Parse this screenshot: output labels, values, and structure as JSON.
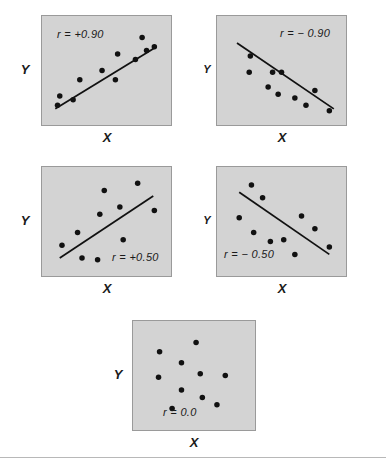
{
  "figure": {
    "background": "#ffffff",
    "panel_fill": "#d3d3d3",
    "panel_border": "#9a9a9a",
    "point_color": "#111111",
    "line_color": "#111111",
    "rule_y": 457
  },
  "labels": {
    "x_axis": "X",
    "y_axis": "Y"
  },
  "chart_data": [
    {
      "id": "panel-r-plus-090",
      "type": "scatter",
      "title": "",
      "annotation": "r = +0.90",
      "r_value": 0.9,
      "xlabel": "X",
      "ylabel": "Y",
      "xlim": [
        0,
        100
      ],
      "ylim": [
        0,
        100
      ],
      "grid": false,
      "legend": "none",
      "points": [
        [
          6,
          12
        ],
        [
          8,
          22
        ],
        [
          20,
          18
        ],
        [
          26,
          40
        ],
        [
          46,
          50
        ],
        [
          58,
          40
        ],
        [
          60,
          68
        ],
        [
          76,
          62
        ],
        [
          82,
          86
        ],
        [
          86,
          72
        ],
        [
          93,
          76
        ]
      ],
      "trendline": {
        "x1": 4,
        "y1": 8,
        "x2": 95,
        "y2": 76
      }
    },
    {
      "id": "panel-r-minus-090",
      "type": "scatter",
      "title": "",
      "annotation": "r = − 0.90",
      "r_value": -0.9,
      "xlabel": "X",
      "ylabel": "Y",
      "xlim": [
        0,
        100
      ],
      "ylim": [
        0,
        100
      ],
      "grid": false,
      "legend": "none",
      "points": [
        [
          22,
          66
        ],
        [
          21,
          48
        ],
        [
          42,
          48
        ],
        [
          50,
          48
        ],
        [
          38,
          32
        ],
        [
          47,
          24
        ],
        [
          62,
          20
        ],
        [
          72,
          12
        ],
        [
          80,
          28
        ],
        [
          93,
          6
        ]
      ],
      "trendline": {
        "x1": 10,
        "y1": 80,
        "x2": 97,
        "y2": 8
      }
    },
    {
      "id": "panel-r-plus-050",
      "type": "scatter",
      "title": "",
      "annotation": "r = +0.50",
      "r_value": 0.5,
      "xlabel": "X",
      "ylabel": "Y",
      "xlim": [
        0,
        100
      ],
      "ylim": [
        0,
        100
      ],
      "grid": false,
      "legend": "none",
      "points": [
        [
          10,
          24
        ],
        [
          24,
          38
        ],
        [
          28,
          10
        ],
        [
          42,
          8
        ],
        [
          44,
          58
        ],
        [
          48,
          84
        ],
        [
          62,
          66
        ],
        [
          65,
          30
        ],
        [
          78,
          92
        ],
        [
          93,
          62
        ]
      ],
      "trendline": {
        "x1": 8,
        "y1": 10,
        "x2": 92,
        "y2": 78
      }
    },
    {
      "id": "panel-r-minus-050",
      "type": "scatter",
      "title": "",
      "annotation": "r = − 0.50",
      "r_value": -0.5,
      "xlabel": "X",
      "ylabel": "Y",
      "xlim": [
        0,
        100
      ],
      "ylim": [
        0,
        100
      ],
      "grid": false,
      "legend": "none",
      "points": [
        [
          12,
          54
        ],
        [
          23,
          90
        ],
        [
          25,
          38
        ],
        [
          33,
          76
        ],
        [
          40,
          28
        ],
        [
          52,
          30
        ],
        [
          62,
          14
        ],
        [
          68,
          56
        ],
        [
          80,
          42
        ],
        [
          93,
          22
        ]
      ],
      "trendline": {
        "x1": 12,
        "y1": 82,
        "x2": 93,
        "y2": 14
      }
    },
    {
      "id": "panel-r-zero",
      "type": "scatter",
      "title": "",
      "annotation": "r = 0.0",
      "r_value": 0.0,
      "xlabel": "X",
      "ylabel": "Y",
      "xlim": [
        0,
        100
      ],
      "ylim": [
        0,
        100
      ],
      "grid": false,
      "legend": "none",
      "points": [
        [
          17,
          76
        ],
        [
          16,
          48
        ],
        [
          29,
          14
        ],
        [
          38,
          64
        ],
        [
          38,
          34
        ],
        [
          52,
          86
        ],
        [
          56,
          52
        ],
        [
          58,
          26
        ],
        [
          72,
          18
        ],
        [
          80,
          50
        ]
      ],
      "trendline": null
    }
  ]
}
